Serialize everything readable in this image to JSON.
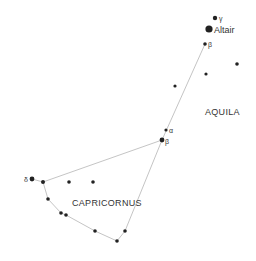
{
  "constellations": [
    {
      "name": "AQUILA",
      "label_x": 205,
      "label_y": 115
    },
    {
      "name": "CAPRICORNUS",
      "label_x": 72,
      "label_y": 206
    }
  ],
  "stars": [
    {
      "id": "gamma-aql",
      "label": "γ",
      "x": 215,
      "y": 18,
      "r": 2.2,
      "lx": 219,
      "ly": 21
    },
    {
      "id": "altair",
      "label": "Altair",
      "x": 209,
      "y": 29,
      "r": 3.6,
      "lx": 214,
      "ly": 33
    },
    {
      "id": "beta-aql",
      "label": "β",
      "x": 205,
      "y": 44,
      "r": 1.8,
      "lx": 208,
      "ly": 47
    },
    {
      "id": "aql-star-1",
      "label": "",
      "x": 237,
      "y": 64,
      "r": 1.8
    },
    {
      "id": "aql-star-2",
      "label": "",
      "x": 206,
      "y": 74,
      "r": 1.6
    },
    {
      "id": "aql-star-3",
      "label": "",
      "x": 175,
      "y": 86,
      "r": 1.6
    },
    {
      "id": "alpha-cap",
      "label": "α",
      "x": 166,
      "y": 130,
      "r": 1.6,
      "lx": 169,
      "ly": 133
    },
    {
      "id": "beta-cap",
      "label": "β",
      "x": 162,
      "y": 140,
      "r": 2.4,
      "lx": 165,
      "ly": 144
    },
    {
      "id": "delta-cap",
      "label": "δ",
      "x": 32,
      "y": 179,
      "r": 2.4,
      "lx": 24,
      "ly": 182
    },
    {
      "id": "cap-star-2",
      "label": "",
      "x": 43,
      "y": 182,
      "r": 2.0
    },
    {
      "id": "cap-star-3",
      "label": "",
      "x": 69,
      "y": 182,
      "r": 1.8
    },
    {
      "id": "cap-star-4",
      "label": "",
      "x": 93,
      "y": 182,
      "r": 1.8
    },
    {
      "id": "cap-star-5",
      "label": "",
      "x": 48,
      "y": 199,
      "r": 1.8
    },
    {
      "id": "cap-star-6",
      "label": "",
      "x": 61,
      "y": 213,
      "r": 1.8
    },
    {
      "id": "cap-star-7",
      "label": "",
      "x": 66,
      "y": 215,
      "r": 1.8
    },
    {
      "id": "cap-star-8",
      "label": "",
      "x": 95,
      "y": 231,
      "r": 1.8
    },
    {
      "id": "cap-star-9",
      "label": "",
      "x": 117,
      "y": 241,
      "r": 1.8
    },
    {
      "id": "cap-star-10",
      "label": "",
      "x": 125,
      "y": 231,
      "r": 1.8
    }
  ],
  "lines": [
    [
      205,
      44,
      162,
      140
    ],
    [
      32,
      179,
      43,
      182
    ],
    [
      43,
      182,
      162,
      140
    ],
    [
      43,
      182,
      48,
      199
    ],
    [
      48,
      199,
      61,
      213
    ],
    [
      61,
      213,
      66,
      215
    ],
    [
      66,
      215,
      95,
      231
    ],
    [
      95,
      231,
      117,
      241
    ],
    [
      117,
      241,
      125,
      231
    ],
    [
      125,
      231,
      162,
      140
    ]
  ],
  "colors": {
    "star": "#222222",
    "line": "#bdbdbd",
    "text": "#333333"
  }
}
